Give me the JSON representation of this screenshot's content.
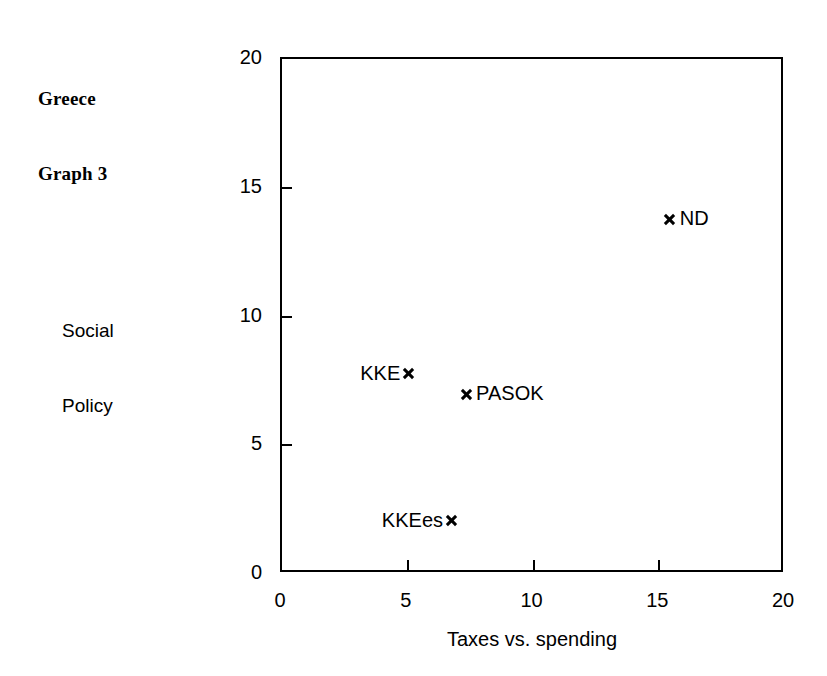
{
  "figure": {
    "title_lines": [
      "Greece",
      "Graph 3"
    ],
    "background_color": "#ffffff",
    "foreground_color": "#000000"
  },
  "chart_data": {
    "type": "scatter",
    "title": "Greece Graph 3",
    "xlabel": "Taxes vs. spending",
    "ylabel": "Social Policy",
    "ylabel_lines": [
      "Social",
      "Policy"
    ],
    "xlim": [
      0,
      20
    ],
    "ylim": [
      0,
      20
    ],
    "xticks": [
      0,
      5,
      10,
      15,
      20
    ],
    "yticks": [
      0,
      5,
      10,
      15,
      20
    ],
    "xtick_labels": [
      "0",
      "5",
      "10",
      "15",
      "20"
    ],
    "ytick_labels": [
      "0",
      "5",
      "10",
      "15",
      "20"
    ],
    "grid": false,
    "legend": false,
    "marker": "x",
    "points": [
      {
        "name": "ND",
        "x": 15.5,
        "y": 13.7,
        "label_side": "right"
      },
      {
        "name": "KKE",
        "x": 5.1,
        "y": 7.7,
        "label_side": "left"
      },
      {
        "name": "PASOK",
        "x": 7.4,
        "y": 6.9,
        "label_side": "right"
      },
      {
        "name": "KKEes",
        "x": 6.8,
        "y": 2.0,
        "label_side": "left"
      }
    ]
  }
}
